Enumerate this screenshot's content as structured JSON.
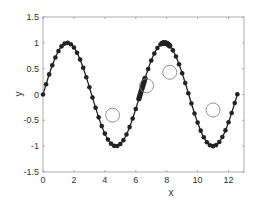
{
  "chart_data": {
    "type": "line",
    "title": "",
    "xlabel": "x",
    "ylabel": "y",
    "xlim": [
      0,
      13
    ],
    "ylim": [
      -1.5,
      1.5
    ],
    "xticks": [
      0,
      2,
      4,
      6,
      8,
      10,
      12
    ],
    "xtick_labels": [
      "0",
      "2",
      "4",
      "6",
      "8",
      "10",
      "12"
    ],
    "yticks": [
      -1.5,
      -1,
      -0.5,
      0,
      0.5,
      1,
      1.5
    ],
    "ytick_labels": [
      "-1.5",
      "-1",
      "-0.5",
      "0",
      "0.5",
      "1",
      "1.5"
    ],
    "grid": false,
    "legend": null,
    "series": [
      {
        "name": "sin(x)",
        "function": "sin",
        "x_start": 0,
        "x_end": 12.57,
        "step": 0.2,
        "marker": "filled-circle",
        "color": "#222222"
      }
    ],
    "dense_clusters": [
      {
        "x_start": 6.2,
        "x_end": 6.6,
        "step": 0.04
      },
      {
        "x_start": 7.7,
        "x_end": 8.2,
        "step": 0.05
      }
    ],
    "highlight_points": [
      {
        "x": 4.5,
        "y": -0.4
      },
      {
        "x": 6.7,
        "y": 0.17
      },
      {
        "x": 8.2,
        "y": 0.43
      },
      {
        "x": 11.0,
        "y": -0.3
      }
    ],
    "colors": {
      "line": "#222222",
      "marker": "#222222",
      "highlight": "#888888",
      "axis": "#999999",
      "text": "#333333"
    }
  }
}
